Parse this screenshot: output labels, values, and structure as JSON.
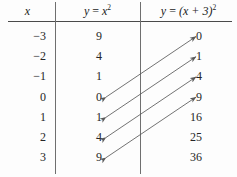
{
  "figure": {
    "type": "math-table-with-mapping-arrows",
    "background_color": "#fdfdfd",
    "text_color": "#262626",
    "rule_color": "#4a4a4a",
    "arrow_color": "#5a5a5a"
  },
  "table": {
    "headers": {
      "col1": "x",
      "col2_lhs": "y",
      "col2_eq": " = ",
      "col2_base": "x",
      "col2_exp": "2",
      "col3_lhs": "y",
      "col3_eq": " = ",
      "col3_base": "(x + 3)",
      "col3_exp": "2"
    },
    "rows": [
      {
        "x": "−3",
        "y1": "9",
        "y2": "0"
      },
      {
        "x": "−2",
        "y1": "4",
        "y2": "1"
      },
      {
        "x": "−1",
        "y1": "1",
        "y2": "4"
      },
      {
        "x": "0",
        "y1": "0",
        "y2": "9"
      },
      {
        "x": "1",
        "y1": "1",
        "y2": "16"
      },
      {
        "x": "2",
        "y1": "4",
        "y2": "25"
      },
      {
        "x": "3",
        "y1": "9",
        "y2": "36"
      }
    ]
  },
  "arrows": {
    "description": "double-headed arrows linking equal y-values, shifted three rows",
    "color": "#5a5a5a",
    "pairs": [
      {
        "from_value": "0",
        "from_row": 4,
        "to_value": "0",
        "to_row": 1
      },
      {
        "from_value": "1",
        "from_row": 5,
        "to_value": "1",
        "to_row": 2
      },
      {
        "from_value": "4",
        "from_row": 6,
        "to_value": "4",
        "to_row": 3
      },
      {
        "from_value": "9",
        "from_row": 7,
        "to_value": "9",
        "to_row": 4
      }
    ]
  }
}
